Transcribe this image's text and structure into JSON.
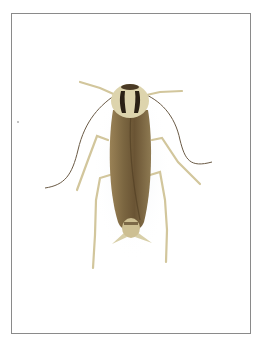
{
  "image": {
    "subject": "cockroach",
    "description": "Top-down photo of a German cockroach on a white background inside a thin gray frame",
    "colors": {
      "background": "#ffffff",
      "frame": "#8a8a8a",
      "body": "#7a6540",
      "body_dark": "#5a4528",
      "pronotum": "#d8cfa8",
      "stripe": "#2a2015",
      "legs": "#d9cfa5",
      "antenna": "#6a5a45"
    }
  }
}
